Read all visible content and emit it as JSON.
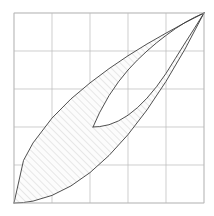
{
  "figure": {
    "title": "",
    "background_color": "#ffffff",
    "width": 214,
    "height": 216
  },
  "plot_area": {
    "left": 14,
    "top": 13,
    "right": 204,
    "bottom": 203,
    "width": 190,
    "height": 190
  },
  "grid": {
    "visible": true,
    "color": "#b9b9b9",
    "line_width": 0.7,
    "columns": 5,
    "rows": 5,
    "x_positions": [
      14,
      52,
      90,
      128,
      166,
      204
    ],
    "y_positions": [
      13,
      51,
      89,
      127,
      165,
      203
    ],
    "border_color": "#b9b9b9"
  },
  "curves": {
    "stroke_color": "#3c3c3c",
    "line_width": 0.9,
    "outer_upper_label": "upper-boundary-curve",
    "outer_lower_label": "lower-boundary-curve",
    "inner_upper_label": "inner-upper-curve",
    "inner_lower_label": "inner-lower-curve"
  },
  "hatching": {
    "visible": true,
    "color": "#9a9a9a",
    "line_width": 0.45,
    "angle_degrees": 45,
    "spacing": 5,
    "fill_color": "#fcfcfc"
  },
  "chart_data": {
    "type": "line",
    "title": "",
    "xlabel": "",
    "ylabel": "",
    "xlim": [
      0,
      1
    ],
    "ylim": [
      0,
      1
    ],
    "grid": true,
    "legend": "none",
    "annotations": [
      {
        "name": "origin-vertex",
        "x": 0.0,
        "y": 0.0,
        "note": "bottom-left meeting point of the two outer curves"
      },
      {
        "name": "apex-vertex",
        "x": 1.0,
        "y": 1.0,
        "note": "top-right meeting point of the two outer curves"
      },
      {
        "name": "cusp-vertex",
        "x": 0.416,
        "y": 0.4,
        "note": "interior cusp where the two inner curves meet"
      }
    ],
    "series": [
      {
        "name": "outer upper boundary",
        "kind": "power",
        "exponent": 0.5,
        "x": [
          0.0,
          0.05,
          0.1,
          0.2,
          0.3,
          0.4,
          0.5,
          0.6,
          0.7,
          0.8,
          0.9,
          1.0
        ],
        "y": [
          0.0,
          0.224,
          0.316,
          0.447,
          0.548,
          0.632,
          0.707,
          0.775,
          0.837,
          0.894,
          0.949,
          1.0
        ]
      },
      {
        "name": "outer lower boundary",
        "kind": "power",
        "exponent": 2.0,
        "x": [
          0.0,
          0.05,
          0.1,
          0.2,
          0.3,
          0.4,
          0.5,
          0.6,
          0.7,
          0.8,
          0.9,
          1.0
        ],
        "y": [
          0.0,
          0.0025,
          0.01,
          0.04,
          0.09,
          0.16,
          0.25,
          0.36,
          0.49,
          0.64,
          0.81,
          1.0
        ]
      },
      {
        "name": "inner upper boundary",
        "kind": "power-shifted",
        "x": [
          0.416,
          0.45,
          0.5,
          0.55,
          0.6,
          0.65,
          0.7,
          0.75,
          0.8,
          0.85,
          0.9,
          0.95,
          1.0
        ],
        "y": [
          0.4,
          0.475,
          0.565,
          0.638,
          0.7,
          0.753,
          0.8,
          0.843,
          0.882,
          0.918,
          0.95,
          0.977,
          1.0
        ]
      },
      {
        "name": "inner lower boundary",
        "kind": "power-shifted",
        "x": [
          0.416,
          0.45,
          0.5,
          0.55,
          0.6,
          0.65,
          0.7,
          0.75,
          0.8,
          0.85,
          0.9,
          0.95,
          1.0
        ],
        "y": [
          0.4,
          0.402,
          0.412,
          0.432,
          0.462,
          0.502,
          0.552,
          0.612,
          0.682,
          0.762,
          0.842,
          0.92,
          1.0
        ]
      }
    ],
    "shaded_regions": [
      {
        "name": "upper-left-hatched-lobe",
        "note": "between outer upper curve and inner upper curve, hatched 45 degrees"
      },
      {
        "name": "lower-right-hatched-lobe",
        "note": "between outer lower curve and inner lower curve, hatched 45 degrees"
      },
      {
        "name": "inner-white-region",
        "note": "unfilled area bounded by the two inner curves and the cusp"
      }
    ]
  }
}
